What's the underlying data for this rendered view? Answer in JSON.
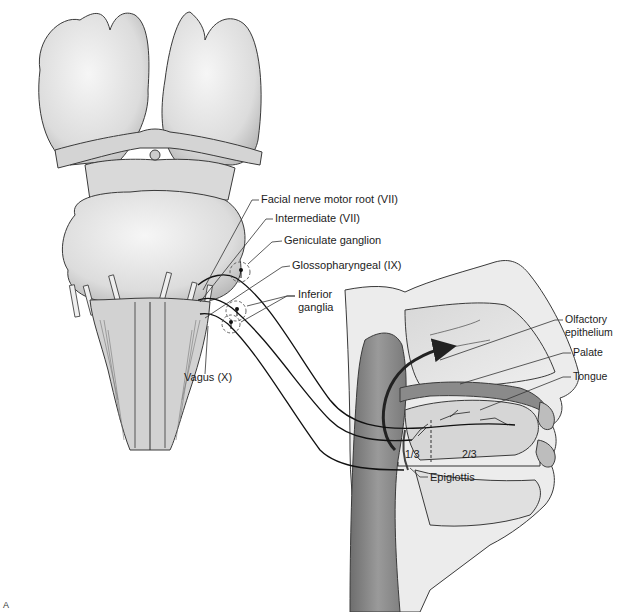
{
  "figure": {
    "panel_letter": "A",
    "regions": {
      "brainstem": "brainstem-ventral-view",
      "head": "head-sagittal-section"
    }
  },
  "labels": {
    "facial_motor_root": "Facial nerve motor root (VII)",
    "intermediate": "Intermediate (VII)",
    "geniculate_ganglion": "Geniculate ganglion",
    "glossopharyngeal": "Glossopharyngeal (IX)",
    "inferior_ganglia_line1": "Inferior",
    "inferior_ganglia_line2": "ganglia",
    "vagus": "Vagus (X)",
    "olfactory_line1": "Olfactory",
    "olfactory_line2": "epithelium",
    "palate": "Palate",
    "tongue": "Tongue",
    "anterior_fraction": "2/3",
    "posterior_fraction": "1/3",
    "epiglottis": "Epiglottis"
  },
  "colors": {
    "tissue_light": "#e6e6e6",
    "tissue_mid": "#c9c9c9",
    "tissue_dark": "#8f8f8f",
    "outline": "#3a3a3a",
    "nerve": "#111111"
  }
}
